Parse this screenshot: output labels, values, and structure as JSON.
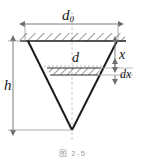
{
  "figure": {
    "caption": "图 2-5",
    "labels": {
      "top_diameter": "d",
      "top_diameter_subscript": "0",
      "height": "h",
      "strip_diameter": "d",
      "depth": "x",
      "strip_thickness": "dx"
    },
    "colors": {
      "outline": "#1c1c1c",
      "dimension_line": "#7d7d7d",
      "hatch": "#2a2a2a",
      "centerline": "#bdbdbd",
      "background": "#ffffff"
    },
    "geometry": {
      "top_line_y": 41,
      "apex_x": 72,
      "apex_y": 130,
      "left_vertex_x": 28,
      "right_vertex_x": 117,
      "strip_top_y": 68,
      "strip_bottom_y": 75
    }
  }
}
